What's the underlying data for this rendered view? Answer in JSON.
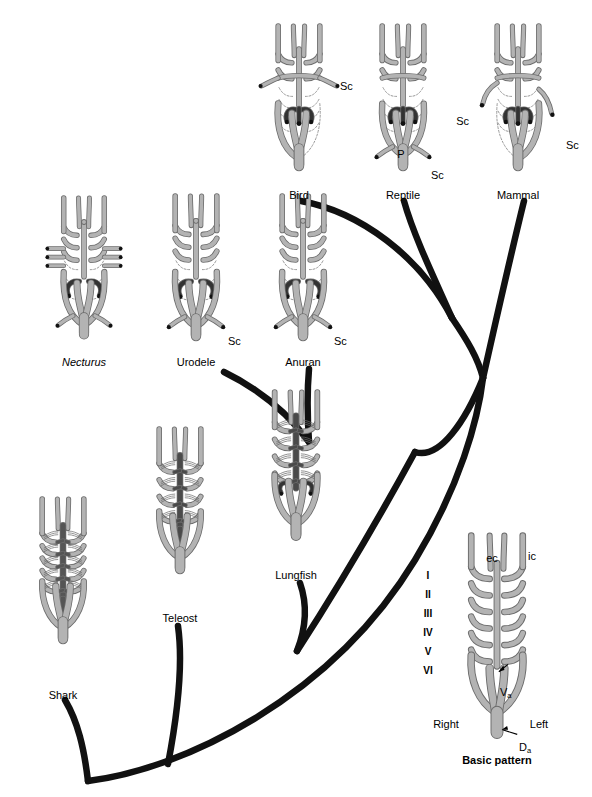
{
  "figure": {
    "type": "comparative-anatomy-diagram",
    "background": "#ffffff"
  },
  "colors": {
    "vessel_fill": "#b3b3b3",
    "vessel_stroke": "#6b6b6b",
    "dark_vessel": "#4a4a4a",
    "darkest_vessel": "#333333",
    "dashed_vestigial": "#8c8c8c",
    "tree_branch": "#111111",
    "text": "#000000"
  },
  "taxa": [
    {
      "id": "shark",
      "label": "Shark",
      "label_x": 63,
      "label_y": 690,
      "cx": 63,
      "cy": 575,
      "scale": 0.8,
      "style": "fish",
      "arch_count": 5,
      "dark_dorsal_aorta": true,
      "dark_shade": "#555555",
      "dashed": false,
      "annotations": []
    },
    {
      "id": "teleost",
      "label": "Teleost",
      "label_x": 180,
      "label_y": 613,
      "cx": 180,
      "cy": 505,
      "scale": 0.8,
      "style": "fish",
      "arch_count": 4,
      "dark_dorsal_aorta": true,
      "dark_shade": "#4a4a4a",
      "dashed": false,
      "annotations": []
    },
    {
      "id": "lungfish",
      "label": "Lungfish",
      "label_x": 296,
      "label_y": 570,
      "cx": 296,
      "cy": 470,
      "scale": 0.82,
      "style": "lungfish",
      "arch_count": 4,
      "dark_dorsal_aorta": true,
      "dark_shade": "#4a4a4a",
      "dashed": false,
      "annotations": []
    },
    {
      "id": "necturus",
      "label": "Necturus",
      "italic": true,
      "label_x": 84,
      "label_y": 357,
      "cx": 84,
      "cy": 272,
      "scale": 0.78,
      "style": "amphibian",
      "arch_count": 3,
      "dark_dorsal_aorta": false,
      "dashed": true,
      "external_gills": true,
      "annotations": []
    },
    {
      "id": "urodele",
      "label": "Urodele",
      "label_x": 196,
      "label_y": 357,
      "cx": 196,
      "cy": 272,
      "scale": 0.8,
      "style": "amphibian",
      "arch_count": 3,
      "dark_dorsal_aorta": false,
      "dashed": true,
      "annotations": [
        {
          "text": "Sc",
          "x": 228,
          "y": 336,
          "anchor": "start"
        }
      ]
    },
    {
      "id": "anuran",
      "label": "Anuran",
      "label_x": 303,
      "label_y": 357,
      "cx": 303,
      "cy": 272,
      "scale": 0.8,
      "style": "amphibian",
      "arch_count": 3,
      "dark_dorsal_aorta": false,
      "dashed": true,
      "annotations": [
        {
          "text": "Sc",
          "x": 334,
          "y": 336,
          "anchor": "start"
        }
      ]
    },
    {
      "id": "bird",
      "label": "Bird",
      "label_x": 299,
      "label_y": 190,
      "cx": 299,
      "cy": 102,
      "scale": 0.8,
      "style": "amniote",
      "aorta_side": "right",
      "dark_dorsal_aorta": false,
      "dashed": true,
      "annotations": [
        {
          "text": "Sc",
          "x": 340,
          "y": 81,
          "anchor": "start"
        }
      ]
    },
    {
      "id": "reptile",
      "label": "Reptile",
      "label_x": 403,
      "label_y": 190,
      "cx": 403,
      "cy": 102,
      "scale": 0.8,
      "style": "amniote",
      "aorta_side": "both",
      "dark_dorsal_aorta": false,
      "dashed": true,
      "annotations": [
        {
          "text": "P",
          "x": 401,
          "y": 149,
          "anchor": "middle"
        },
        {
          "text": "Sc",
          "x": 431,
          "y": 170,
          "anchor": "start"
        }
      ]
    },
    {
      "id": "mammal",
      "label": "Mammal",
      "label_x": 518,
      "label_y": 190,
      "cx": 518,
      "cy": 102,
      "scale": 0.8,
      "style": "amniote",
      "aorta_side": "left",
      "dark_dorsal_aorta": false,
      "dashed": true,
      "annotations": [
        {
          "text": "Sc",
          "x": 469,
          "y": 116,
          "anchor": "end"
        },
        {
          "text": "Sc",
          "x": 566,
          "y": 140,
          "anchor": "start"
        }
      ]
    }
  ],
  "basic_pattern": {
    "id": "basic-pattern",
    "label": "Basic pattern",
    "label_x": 497,
    "label_y": 755,
    "cx": 497,
    "cy": 635,
    "scale": 0.92,
    "arch_numerals": [
      "I",
      "II",
      "III",
      "IV",
      "V",
      "VI"
    ],
    "numeral_x": 428,
    "numeral_ys": [
      570,
      589,
      608,
      627,
      646,
      665
    ],
    "vessel_labels": [
      {
        "text": "ec",
        "x": 492,
        "y": 553,
        "anchor": "middle",
        "name": "external-carotid-label"
      },
      {
        "text": "ic",
        "x": 528,
        "y": 551,
        "anchor": "start",
        "name": "internal-carotid-label"
      }
    ],
    "side_labels": [
      {
        "text": "Right",
        "x": 446,
        "y": 719,
        "anchor": "middle",
        "name": "right-side-label"
      },
      {
        "text": "Left",
        "x": 539,
        "y": 719,
        "anchor": "middle",
        "name": "left-side-label"
      }
    ],
    "pointer_labels": [
      {
        "text": "V",
        "sub": "a",
        "x": 500,
        "y": 687,
        "name": "ventral-aorta-label"
      },
      {
        "text": "D",
        "sub": "a",
        "x": 519,
        "y": 742,
        "name": "dorsal-aorta-label"
      }
    ]
  },
  "tree": {
    "name": "phylogenetic-tree",
    "branches": [
      {
        "id": "trunk",
        "d": "M 88 781 C 180 770 330 700 415 560 C 460 486 478 420 483 378"
      },
      {
        "id": "shark-branch",
        "d": "M 65 700 C 78 722 84 748 88 781"
      },
      {
        "id": "teleost-branch",
        "d": "M 178 626 C 183 662 178 712 168 764"
      },
      {
        "id": "lungfish-branch",
        "d": "M 300 583 C 308 606 306 628 297 651"
      },
      {
        "id": "tetrapod-stem",
        "d": "M 297 651 C 330 600 378 520 415 452"
      },
      {
        "id": "amphibian-node",
        "d": "M 224 372 C 265 392 290 416 309 442"
      },
      {
        "id": "anuran-branch",
        "d": "M 309 369 C 307 392 307 412 309 442"
      },
      {
        "id": "amniote-node",
        "d": "M 483 378 C 466 420 440 460 415 452"
      },
      {
        "id": "bird-branch",
        "d": "M 301 201 C 360 212 420 256 452 318"
      },
      {
        "id": "reptile-branch",
        "d": "M 404 201 C 412 230 428 265 452 318"
      },
      {
        "id": "sauropsid-stem",
        "d": "M 452 318 C 467 340 478 358 483 378"
      },
      {
        "id": "mammal-branch",
        "d": "M 524 201 C 512 250 496 320 483 378"
      }
    ],
    "stroke_width": 6.5
  }
}
